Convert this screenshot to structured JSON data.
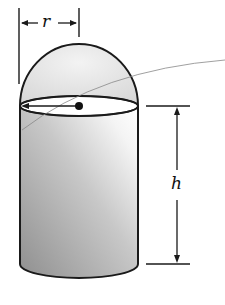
{
  "diagram": {
    "labels": {
      "radius": "r",
      "height": "h"
    },
    "colors": {
      "stroke": "#1a1a1a",
      "dome_fill": "#e6e6e6",
      "body_dark": "#9a9a9a",
      "body_light": "#f2f2f2",
      "leader": "#777777"
    }
  }
}
